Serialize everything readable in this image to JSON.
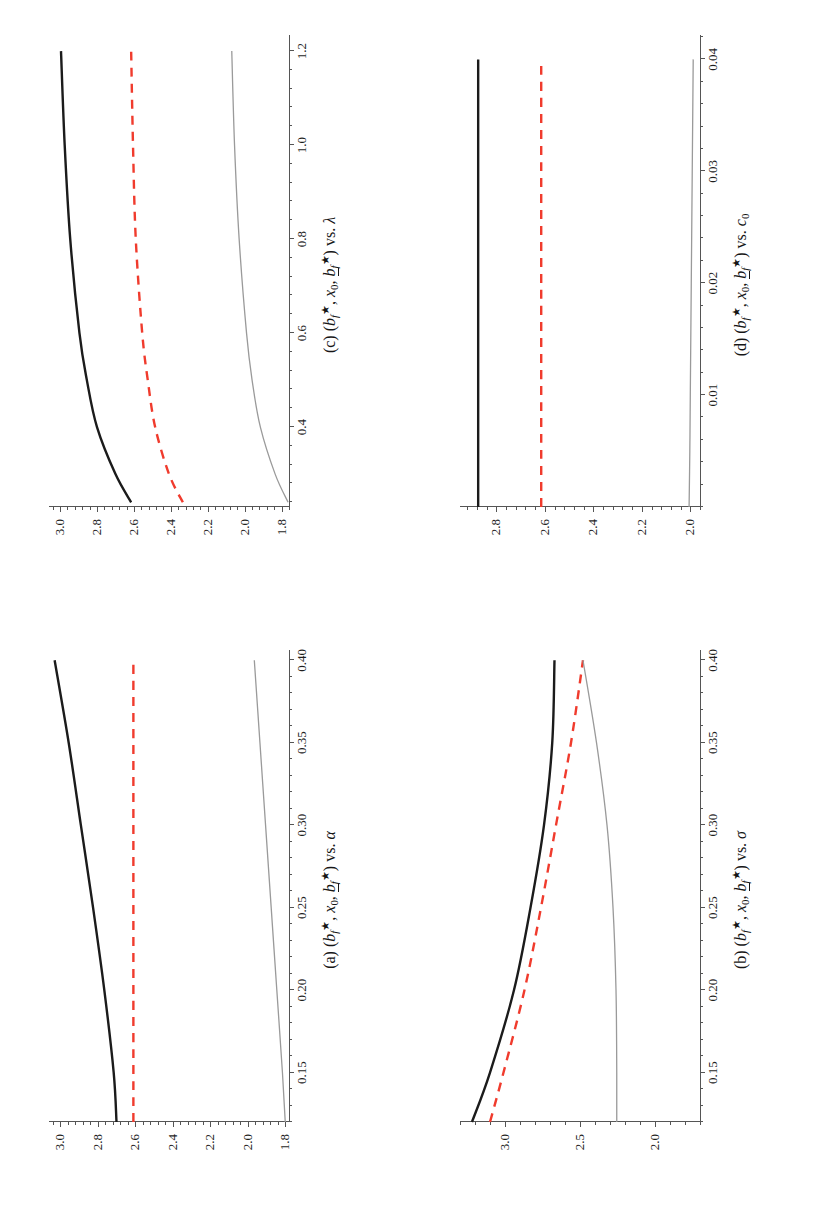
{
  "figure": {
    "orientation": "rotated-90-ccw",
    "panel_count": 4,
    "series_colors": {
      "b_f_star": "#1b1b1b",
      "x0": "#f03b2d",
      "b_f_lower_star": "#9a9a9a"
    },
    "series_names": [
      "b_f_star",
      "x0",
      "b_f_lower_star"
    ]
  },
  "panels": {
    "a": {
      "tag": "(a)",
      "caption_math": "(bₓ★, x₀, b̲★) vs. α",
      "caption_plain": "(a) (b_f*, x_0, b_f_lower*) vs. α",
      "xlabel": "α",
      "xticks": [
        "0.15",
        "0.20",
        "0.25",
        "0.30",
        "0.35",
        "0.40"
      ],
      "xtick_values": [
        0.15,
        0.2,
        0.25,
        0.3,
        0.35,
        0.4
      ],
      "yticks": [
        "3.0",
        "2.8",
        "2.6",
        "2.4",
        "2.2",
        "2.0",
        "1.8"
      ],
      "ytick_values": [
        3.0,
        2.8,
        2.6,
        2.4,
        2.2,
        2.0,
        1.8
      ],
      "xlim": [
        0.12,
        0.405
      ],
      "ylim": [
        1.78,
        3.06
      ]
    },
    "b": {
      "tag": "(b)",
      "caption_plain": "(b) (b_f*, x_0, b_f_lower*) vs. σ",
      "xlabel": "σ",
      "xticks": [
        "0.15",
        "0.20",
        "0.25",
        "0.30",
        "0.35",
        "0.40"
      ],
      "xtick_values": [
        0.15,
        0.2,
        0.25,
        0.3,
        0.35,
        0.4
      ],
      "yticks": [
        "3.0",
        "2.5",
        "2.0"
      ],
      "ytick_values": [
        3.0,
        2.5,
        2.0
      ],
      "xlim": [
        0.12,
        0.405
      ],
      "ylim": [
        1.7,
        3.3
      ]
    },
    "c": {
      "tag": "(c)",
      "caption_plain": "(c) (b_f*, x_0, b_f_lower*) vs. λ",
      "xlabel": "λ",
      "xticks": [
        "0.4",
        "0.6",
        "0.8",
        "1.0",
        "1.2"
      ],
      "xtick_values": [
        0.4,
        0.6,
        0.8,
        1.0,
        1.2
      ],
      "yticks": [
        "3.0",
        "2.8",
        "2.6",
        "2.4",
        "2.2",
        "2.0",
        "1.8"
      ],
      "ytick_values": [
        3.0,
        2.8,
        2.6,
        2.4,
        2.2,
        2.0,
        1.8
      ],
      "xlim": [
        0.23,
        1.23
      ],
      "ylim": [
        1.76,
        3.06
      ]
    },
    "d": {
      "tag": "(d)",
      "caption_plain": "(d) (b_f*, x_0, b_f_lower*) vs. c_0",
      "xlabel": "c₀",
      "xticks": [
        "0.01",
        "0.02",
        "0.03",
        "0.04"
      ],
      "xtick_values": [
        0.01,
        0.02,
        0.03,
        0.04
      ],
      "yticks": [
        "2.8",
        "2.6",
        "2.4",
        "2.2",
        "2.0"
      ],
      "ytick_values": [
        2.8,
        2.6,
        2.4,
        2.2,
        2.0
      ],
      "xlim": [
        0.0,
        0.042
      ],
      "ylim": [
        1.96,
        2.95
      ]
    }
  },
  "chart_data": [
    {
      "id": "a",
      "type": "line",
      "title": "(a) (b_f*, x_0, b_f_lower*) vs. alpha",
      "xlabel": "alpha",
      "ylabel": "",
      "xlim": [
        0.12,
        0.405
      ],
      "ylim": [
        1.78,
        3.06
      ],
      "grid": false,
      "legend": "none",
      "x": [
        0.12,
        0.15,
        0.2,
        0.25,
        0.3,
        0.35,
        0.4
      ],
      "series": [
        {
          "name": "b_f_star",
          "style": "solid",
          "color": "#1b1b1b",
          "width": 2.4,
          "values": [
            2.7,
            2.715,
            2.765,
            2.825,
            2.89,
            2.955,
            3.03
          ]
        },
        {
          "name": "x0",
          "style": "dashed",
          "color": "#f03b2d",
          "width": 2.4,
          "values": [
            2.61,
            2.61,
            2.61,
            2.61,
            2.61,
            2.61,
            2.61
          ]
        },
        {
          "name": "b_f_lower_star",
          "style": "solid",
          "color": "#9a9a9a",
          "width": 1.3,
          "values": [
            1.8,
            1.815,
            1.845,
            1.875,
            1.905,
            1.935,
            1.965
          ]
        }
      ]
    },
    {
      "id": "b",
      "type": "line",
      "title": "(b) (b_f*, x_0, b_f_lower*) vs. sigma",
      "xlabel": "sigma",
      "ylabel": "",
      "xlim": [
        0.12,
        0.405
      ],
      "ylim": [
        1.7,
        3.3
      ],
      "grid": false,
      "legend": "none",
      "x": [
        0.12,
        0.15,
        0.2,
        0.25,
        0.3,
        0.35,
        0.4
      ],
      "series": [
        {
          "name": "b_f_star",
          "style": "solid",
          "color": "#1b1b1b",
          "width": 2.4,
          "values": [
            3.22,
            3.1,
            2.94,
            2.83,
            2.74,
            2.685,
            2.67
          ]
        },
        {
          "name": "x0",
          "style": "dashed",
          "color": "#f03b2d",
          "width": 2.4,
          "values": [
            3.1,
            3.01,
            2.87,
            2.76,
            2.66,
            2.56,
            2.48
          ]
        },
        {
          "name": "b_f_lower_star",
          "style": "solid",
          "color": "#9a9a9a",
          "width": 1.3,
          "values": [
            2.255,
            2.255,
            2.26,
            2.28,
            2.32,
            2.39,
            2.48
          ]
        }
      ]
    },
    {
      "id": "c",
      "type": "line",
      "title": "(c) (b_f*, x_0, b_f_lower*) vs. lambda",
      "xlabel": "lambda",
      "ylabel": "",
      "xlim": [
        0.23,
        1.23
      ],
      "ylim": [
        1.76,
        3.06
      ],
      "grid": false,
      "legend": "none",
      "x": [
        0.24,
        0.3,
        0.4,
        0.5,
        0.6,
        0.8,
        1.0,
        1.2
      ],
      "series": [
        {
          "name": "b_f_star",
          "style": "solid",
          "color": "#1b1b1b",
          "width": 2.4,
          "values": [
            2.615,
            2.7,
            2.8,
            2.855,
            2.895,
            2.945,
            2.975,
            2.995
          ]
        },
        {
          "name": "x0",
          "style": "dashed",
          "color": "#f03b2d",
          "width": 2.4,
          "values": [
            2.335,
            2.41,
            2.485,
            2.525,
            2.555,
            2.59,
            2.605,
            2.615
          ]
        },
        {
          "name": "b_f_lower_star",
          "style": "solid",
          "color": "#9a9a9a",
          "width": 1.3,
          "values": [
            1.765,
            1.835,
            1.915,
            1.96,
            1.99,
            2.03,
            2.055,
            2.07
          ]
        }
      ]
    },
    {
      "id": "d",
      "type": "line",
      "title": "(d) (b_f*, x_0, b_f_lower*) vs. c_0",
      "xlabel": "c_0",
      "ylabel": "",
      "xlim": [
        0.0,
        0.042
      ],
      "ylim": [
        1.96,
        2.95
      ],
      "grid": false,
      "legend": "none",
      "x": [
        0.0,
        0.005,
        0.01,
        0.02,
        0.03,
        0.04
      ],
      "series": [
        {
          "name": "b_f_star",
          "style": "solid",
          "color": "#1b1b1b",
          "width": 2.4,
          "values": [
            2.875,
            2.875,
            2.875,
            2.875,
            2.875,
            2.875
          ]
        },
        {
          "name": "x0",
          "style": "dashed",
          "color": "#f03b2d",
          "width": 2.4,
          "values": [
            2.615,
            2.615,
            2.615,
            2.615,
            2.615,
            2.615
          ]
        },
        {
          "name": "b_f_lower_star",
          "style": "solid",
          "color": "#9a9a9a",
          "width": 1.3,
          "values": [
            2.005,
            2.002,
            2.0,
            1.996,
            1.992,
            1.988
          ]
        }
      ]
    }
  ]
}
